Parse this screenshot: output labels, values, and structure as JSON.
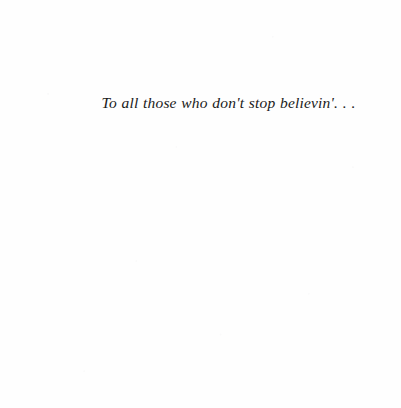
{
  "page": {
    "kind": "book-dedication-page",
    "background_color": "#fefefe",
    "ink_color": "#1a1a1a"
  },
  "dedication": {
    "text": "To all those who don't stop believin'. . .",
    "style": "italic-serif",
    "alignment": "centered"
  }
}
